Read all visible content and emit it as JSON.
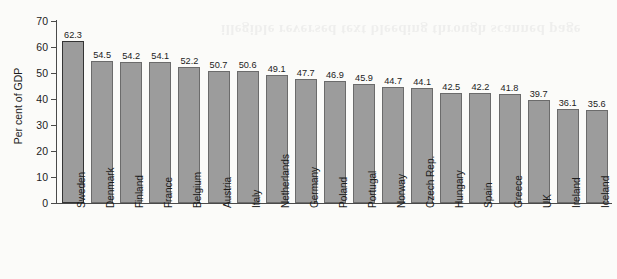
{
  "chart_data": {
    "type": "bar",
    "title": "",
    "xlabel": "",
    "ylabel": "Per cent of GDP",
    "ylim": [
      0,
      70
    ],
    "yticks": [
      0,
      10,
      20,
      30,
      40,
      50,
      60,
      70
    ],
    "grid": false,
    "legend": null,
    "orientation": "vertical",
    "bar_color": "#9c9c9c",
    "bar_edge_color": "#6b6b6b",
    "highlighted_category": "Sweden",
    "categories": [
      "Sweden",
      "Denmark",
      "Finland",
      "France",
      "Belgium",
      "Austria",
      "Italy",
      "Netherlands",
      "Germany",
      "Poland",
      "Portugal",
      "Norway",
      "Czech Rep.",
      "Hungary",
      "Spain",
      "Greece",
      "UK",
      "Ireland",
      "Iceland"
    ],
    "values": [
      62.3,
      54.5,
      54.2,
      54.1,
      52.2,
      50.7,
      50.6,
      49.1,
      47.7,
      46.9,
      45.9,
      44.7,
      44.1,
      42.5,
      42.2,
      41.8,
      39.7,
      36.1,
      35.6
    ],
    "value_labels": [
      "62.3",
      "54.5",
      "54.2",
      "54.1",
      "52.2",
      "50.7",
      "50.6",
      "49.1",
      "47.7",
      "46.9",
      "45.9",
      "44.7",
      "44.1",
      "42.5",
      "42.2",
      "41.8",
      "39.7",
      "36.1",
      "35.6"
    ],
    "tick_labels": [
      "0",
      "10",
      "20",
      "30",
      "40",
      "50",
      "60",
      "70"
    ]
  },
  "page": {
    "background_color": "#fbfbf9",
    "bleed_through_text": "illegible reversed text bleeding through scanned page"
  }
}
